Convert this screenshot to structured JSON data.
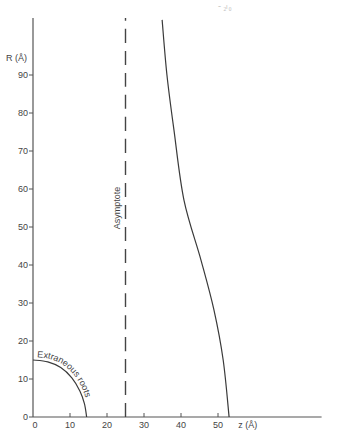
{
  "chart_data": {
    "type": "line",
    "title": "",
    "header_fragment": "- ₂ₗ₀",
    "xlabel": "z (Å)",
    "ylabel": "R (Å)",
    "xlim": [
      0,
      78
    ],
    "ylim": [
      0,
      105
    ],
    "grid": false,
    "x_ticks": [
      0,
      10,
      20,
      30,
      40,
      50
    ],
    "x_tick_labels": [
      "0",
      "10",
      "20",
      "30",
      "40",
      "50"
    ],
    "y_ticks": [
      0,
      10,
      20,
      30,
      40,
      50,
      60,
      70,
      80,
      90
    ],
    "y_tick_labels": [
      "0",
      "10",
      "20",
      "30",
      "40",
      "50",
      "60",
      "70",
      "80",
      "90"
    ],
    "series": [
      {
        "name": "solution",
        "style": "solid",
        "points": [
          [
            34.9,
            104.5
          ],
          [
            36.2,
            90
          ],
          [
            38.1,
            75.5
          ],
          [
            40.8,
            57.1
          ],
          [
            45.4,
            41.3
          ],
          [
            48.9,
            28.2
          ],
          [
            51.4,
            15
          ],
          [
            53.0,
            0
          ]
        ]
      },
      {
        "name": "Extraneous roots",
        "style": "solid",
        "points": [
          [
            0,
            15
          ],
          [
            4,
            14.5
          ],
          [
            7.5,
            13
          ],
          [
            10.5,
            10.3
          ],
          [
            12.7,
            6.8
          ],
          [
            13.9,
            3.5
          ],
          [
            14.5,
            0
          ]
        ]
      },
      {
        "name": "Asymptote",
        "style": "dashed",
        "points": [
          [
            25,
            0
          ],
          [
            25,
            105
          ]
        ]
      }
    ],
    "annotations": [
      {
        "text": "Asymptote",
        "anchor": [
          23.5,
          55
        ],
        "rotation": "vertical"
      },
      {
        "text": "Extraneous roots",
        "anchor": "along extraneous-roots curve"
      }
    ]
  }
}
